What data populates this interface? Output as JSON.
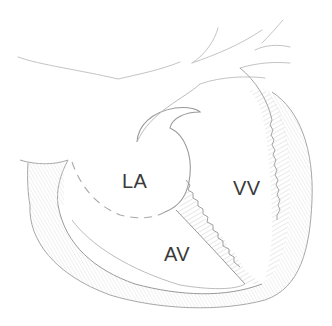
{
  "diagram": {
    "type": "anatomical-sketch",
    "style": "pencil sketch",
    "colors": {
      "stroke": "#9a9a9a",
      "stroke_light": "#c4c4c4",
      "hatch": "#bdbdbd",
      "label": "#3a3a3a",
      "background": "#ffffff"
    },
    "labels": [
      {
        "id": "la",
        "text": "LA",
        "x": 122,
        "y": 171
      },
      {
        "id": "vv",
        "text": "VV",
        "x": 233,
        "y": 178
      },
      {
        "id": "av",
        "text": "AV",
        "x": 164,
        "y": 244
      }
    ]
  }
}
